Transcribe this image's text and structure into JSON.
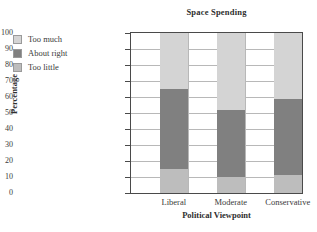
{
  "chart_data": {
    "type": "bar",
    "subtype": "stacked-column",
    "title": "Space Spending",
    "xlabel": "Political Viewpoint",
    "ylabel": "Percentage",
    "categories": [
      "Liberal",
      "Moderate",
      "Conservative"
    ],
    "ylim": [
      0,
      100
    ],
    "yticks": [
      0,
      10,
      20,
      30,
      40,
      50,
      60,
      70,
      80,
      90,
      100
    ],
    "ytick_labels": [
      "0",
      "10",
      "20",
      "30",
      "40",
      "50",
      "60",
      "70",
      "80",
      "90",
      "100"
    ],
    "grid": "horizontal-and-vertical",
    "legend_position": "outside-top-left",
    "series": [
      {
        "name": "Too little",
        "color": "#bdbdbd",
        "stack_order": 0,
        "values": [
          15,
          10,
          11
        ]
      },
      {
        "name": "About right",
        "color": "#808080",
        "stack_order": 1,
        "values": [
          50,
          42,
          48
        ]
      },
      {
        "name": "Too much",
        "color": "#d4d4d4",
        "stack_order": 2,
        "values": [
          35,
          48,
          41
        ]
      }
    ],
    "cumulative_tops": {
      "Liberal": [
        15,
        65,
        100
      ],
      "Moderate": [
        10,
        52,
        100
      ],
      "Conservative": [
        11,
        59,
        100
      ]
    }
  },
  "legend": {
    "items": [
      {
        "label": "Too much",
        "color": "#d4d4d4"
      },
      {
        "label": "About right",
        "color": "#808080"
      },
      {
        "label": "Too little",
        "color": "#bdbdbd"
      }
    ]
  },
  "colors": {
    "too_much": "#d4d4d4",
    "about_right": "#808080",
    "too_little": "#bdbdbd",
    "axis": "#4a4a4a",
    "grid": "#b8b8b8",
    "text": "#3a3a3a",
    "background": "#ffffff"
  }
}
